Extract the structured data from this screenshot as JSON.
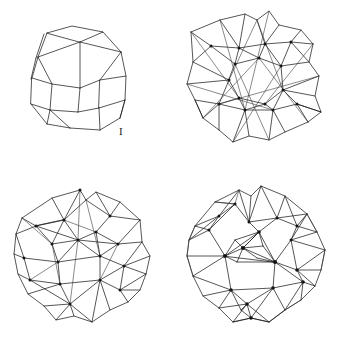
{
  "plate": {
    "title": "Four wireframe polyhedra",
    "background_color": "#ffffff",
    "line_color": "#1d1d1f",
    "vertex_color": "#141416",
    "width": 346,
    "height": 340
  },
  "figures": [
    {
      "label": "I",
      "name": "polyhedron-i",
      "description": "Simple convex wireframe polyhedron with hexagonal and square faces",
      "panel": "top-left",
      "edge_count_visible": 36,
      "vertex_dots": false
    },
    {
      "label": "II",
      "name": "polyhedron-ii",
      "description": "Stellated polyhedron with interpenetrating triangular faces",
      "panel": "top-right",
      "edge_count_visible": 96,
      "vertex_dots": true
    },
    {
      "label": "III",
      "name": "polyhedron-iii",
      "description": "Compound polyhedron with quadrilateral and triangular facets",
      "panel": "bottom-left",
      "edge_count_visible": 104,
      "vertex_dots": true
    },
    {
      "label": "IV",
      "name": "polyhedron-iv",
      "description": "Densely triangulated polyhedron with fan vertices",
      "panel": "bottom-right",
      "edge_count_visible": 132,
      "vertex_dots": true
    }
  ]
}
